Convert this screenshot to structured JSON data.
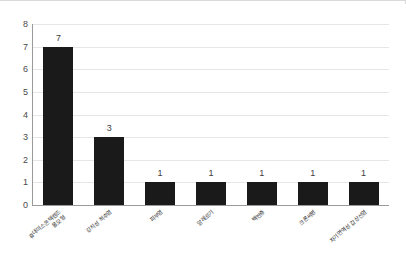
{
  "chart_data": {
    "type": "bar",
    "title": "",
    "subtitle": "",
    "xlabel": "",
    "ylabel": "",
    "ylim": [
      0,
      8
    ],
    "ytick_labels": [
      "8",
      "7",
      "6",
      "5",
      "4",
      "3",
      "2",
      "1",
      "0"
    ],
    "yticks": [
      8,
      7,
      6,
      5,
      4,
      3,
      2,
      1,
      0
    ],
    "grid": true,
    "legend": false,
    "legend_position": "none",
    "bar_color": "#1a1a1a",
    "grid_color": "#e6e6e6",
    "axis_color": "#9a9a9a",
    "categories": [
      "휴대미스콘택렌즈 물모형",
      "강직성 척추염",
      "피부염",
      "알레르기",
      "백반증",
      "크론씨병",
      "자기면역성 갑상선염"
    ],
    "category_lines": [
      [
        "휴대미스콘택렌즈",
        "물모형"
      ],
      [
        "강직성 척추염",
        ""
      ],
      [
        "피부염",
        ""
      ],
      [
        "알레르기",
        ""
      ],
      [
        "백반증",
        ""
      ],
      [
        "크론씨병",
        ""
      ],
      [
        "자기면역성 갑상선염",
        ""
      ]
    ],
    "values": [
      7,
      3,
      1,
      1,
      1,
      1,
      1
    ],
    "value_labels": [
      "7",
      "3",
      "1",
      "1",
      "1",
      "1",
      "1"
    ]
  }
}
